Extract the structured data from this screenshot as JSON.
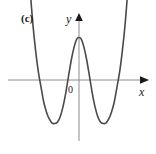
{
  "figure": {
    "panel_label": "(c)",
    "background_color": "#ffffff"
  },
  "axes": {
    "y_label": "y",
    "x_label": "x",
    "origin_label": "0",
    "axis_color": "#8c8c8c",
    "arrow_color": "#1a1a1a",
    "x_axis": {
      "pixel_y": 80,
      "pixel_x_start": 8,
      "pixel_x_end": 148
    },
    "y_axis": {
      "pixel_x": 79,
      "pixel_y_start": 15,
      "pixel_y_end": 141
    }
  },
  "chart_data": {
    "type": "line",
    "title": "(c)",
    "xlabel": "x",
    "ylabel": "y",
    "grid": false,
    "legend": null,
    "annotations": [
      "(c)",
      "0"
    ],
    "symmetry": "even (symmetric about the y-axis)",
    "degree": 4,
    "end_behavior": "both ends rise to positive infinity",
    "xlim": [
      -2.73,
      2.73
    ],
    "ylim": [
      -1.72,
      2.54
    ],
    "x_intercepts": [
      -1.68,
      -0.66,
      0.66,
      1.68
    ],
    "local_maximum": {
      "x": 0,
      "y": 0.84
    },
    "local_minima": [
      {
        "x": -1.23,
        "y": -0.86
      },
      {
        "x": 1.23,
        "y": -0.86
      }
    ],
    "y_intercept": 0.84,
    "series": [
      {
        "name": "y = f(x)",
        "color": "#4a4a4a",
        "x": [
          -2.73,
          -2.58,
          -2.44,
          -2.29,
          -2.15,
          -2.0,
          -1.86,
          -1.71,
          -1.57,
          -1.42,
          -1.28,
          -1.13,
          -0.99,
          -0.84,
          -0.7,
          -0.55,
          -0.41,
          -0.26,
          -0.12,
          0.0,
          0.12,
          0.26,
          0.41,
          0.55,
          0.7,
          0.84,
          0.99,
          1.13,
          1.28,
          1.42,
          1.57,
          1.71,
          1.86,
          2.0,
          2.15,
          2.29,
          2.44,
          2.58,
          2.73
        ],
        "y": [
          2.54,
          1.77,
          1.12,
          0.58,
          0.17,
          -0.15,
          -0.44,
          -0.64,
          -0.77,
          -0.85,
          -0.86,
          -0.83,
          -0.72,
          -0.52,
          -0.26,
          0.08,
          0.39,
          0.65,
          0.81,
          0.84,
          0.81,
          0.65,
          0.39,
          0.08,
          -0.26,
          -0.52,
          -0.72,
          -0.83,
          -0.86,
          -0.85,
          -0.77,
          -0.64,
          -0.44,
          -0.15,
          0.17,
          0.58,
          1.12,
          1.77,
          2.54
        ]
      }
    ],
    "pixel_path": "M 27.5,27 C 29.6,46.5 32.2,64.5 36.2,79.5 C 40.6,96.5 45.2,114 49.8,121.5 C 52.6,126 56.2,126.2 59.2,121.5 C 63.6,114.6 68.6,98 73.2,86 C 75.6,79.6 77.4,37.8 79.2,37.5 C 81,37.8 82.8,79.6 85.2,86 C 89.8,98 94.8,114.6 99.2,121.5 C 102.2,126.2 105.8,126 108.6,121.5 C 113.2,114 117.8,96.5 122.2,79.5 C 126.2,64.5 128.8,46.5 130.9,27"
  }
}
